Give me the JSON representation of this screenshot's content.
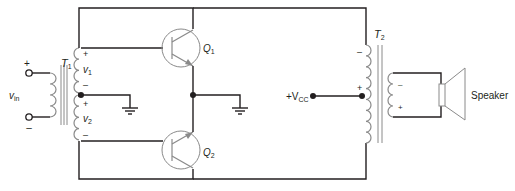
{
  "diagram": {
    "input": {
      "label": "v",
      "label_sub": "in",
      "plus": "+",
      "minus": "–"
    },
    "transformer_t1": {
      "label": "T",
      "label_sub": "1",
      "v1": {
        "label": "v",
        "sub": "1",
        "plus": "+",
        "minus": "–"
      },
      "v2": {
        "label": "v",
        "sub": "2",
        "plus": "+",
        "minus": "–"
      }
    },
    "transistors": [
      {
        "id": "q1",
        "label": "Q",
        "sub": "1",
        "type": "npn"
      },
      {
        "id": "q2",
        "label": "Q",
        "sub": "2",
        "type": "npn"
      }
    ],
    "supply": {
      "label_prefix": "+V",
      "label_sub": "CC"
    },
    "transformer_t2": {
      "label": "T",
      "label_sub": "2",
      "primary": {
        "top": "–",
        "tap": "+"
      },
      "secondary": {
        "top": "–",
        "bottom": "+"
      }
    },
    "speaker": {
      "label": "Speaker"
    },
    "colors": {
      "wire": "#231f20",
      "component": "#8a8a8a"
    }
  }
}
